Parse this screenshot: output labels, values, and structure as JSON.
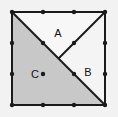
{
  "figure": {
    "background_color": "#f2f2f2",
    "outline_color": "#1a1a1a",
    "dot_color": "#1a1a1a",
    "square": {
      "left": 12,
      "top": 12,
      "right": 105,
      "bottom": 105,
      "stroke_width": 2
    },
    "grid": {
      "columns": 4,
      "rows": 4,
      "spacing": 31,
      "dot_radius": 2.2
    },
    "regions": [
      {
        "id": "A",
        "label": "A",
        "fill": "#f7f7f7",
        "label_x": 58,
        "label_y": 37,
        "points": "12,12 105,12 58.5,58.5"
      },
      {
        "id": "B",
        "label": "B",
        "fill": "#f4f4f4",
        "label_x": 88,
        "label_y": 76,
        "points": "105,12 105,105 58.5,58.5"
      },
      {
        "id": "C",
        "label": "C",
        "fill": "#c8c8c8",
        "label_x": 35,
        "label_y": 78,
        "points": "12,12 58.5,58.5 105,105 12,105"
      }
    ],
    "diagonals": [
      {
        "name": "main-diagonal",
        "x1": 12,
        "y1": 12,
        "x2": 105,
        "y2": 105
      },
      {
        "name": "upper-right-diagonal",
        "x1": 105,
        "y1": 12,
        "x2": 58.5,
        "y2": 58.5
      }
    ],
    "dots": [
      {
        "x": 12,
        "y": 12
      },
      {
        "x": 43,
        "y": 12
      },
      {
        "x": 74,
        "y": 12
      },
      {
        "x": 105,
        "y": 12
      },
      {
        "x": 12,
        "y": 43
      },
      {
        "x": 43,
        "y": 43
      },
      {
        "x": 74,
        "y": 43
      },
      {
        "x": 105,
        "y": 43
      },
      {
        "x": 12,
        "y": 74
      },
      {
        "x": 43,
        "y": 74
      },
      {
        "x": 74,
        "y": 74
      },
      {
        "x": 105,
        "y": 74
      },
      {
        "x": 12,
        "y": 105
      },
      {
        "x": 43,
        "y": 105
      },
      {
        "x": 74,
        "y": 105
      },
      {
        "x": 105,
        "y": 105
      }
    ]
  }
}
